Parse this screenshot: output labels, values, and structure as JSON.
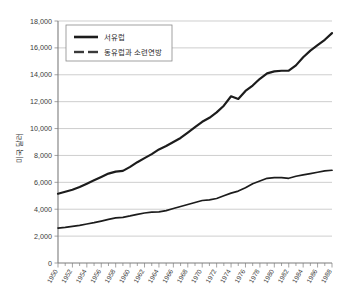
{
  "chart_data": {
    "type": "line",
    "title": "",
    "xlabel": "",
    "ylabel": "미국 달러",
    "ylim": [
      0,
      18000
    ],
    "ytick_values": [
      0,
      2000,
      4000,
      6000,
      8000,
      10000,
      12000,
      14000,
      16000,
      18000
    ],
    "ytick_labels": [
      "0",
      "2,000",
      "4,000",
      "6,000",
      "8,000",
      "10,000",
      "12,000",
      "14,000",
      "16,000",
      "18,000"
    ],
    "grid": true,
    "legend_position": "top-left",
    "x": [
      1950,
      1951,
      1952,
      1953,
      1954,
      1955,
      1956,
      1957,
      1958,
      1959,
      1960,
      1961,
      1962,
      1963,
      1964,
      1965,
      1966,
      1967,
      1968,
      1969,
      1970,
      1971,
      1972,
      1973,
      1974,
      1975,
      1976,
      1977,
      1978,
      1979,
      1980,
      1981,
      1982,
      1983,
      1984,
      1985,
      1986,
      1987,
      1988
    ],
    "xtick_labels": [
      "1950",
      "1952",
      "1954",
      "1956",
      "1958",
      "1960",
      "1962",
      "1964",
      "1966",
      "1968",
      "1970",
      "1972",
      "1974",
      "1976",
      "1978",
      "1980",
      "1982",
      "1984",
      "1986",
      "1988"
    ],
    "series": [
      {
        "name": "서유럽",
        "style": "solid",
        "color": "#1c1c1c",
        "values": [
          5150,
          5300,
          5450,
          5650,
          5900,
          6150,
          6400,
          6650,
          6800,
          6850,
          7150,
          7500,
          7800,
          8100,
          8450,
          8700,
          9000,
          9300,
          9700,
          10100,
          10500,
          10800,
          11200,
          11700,
          12400,
          12200,
          12800,
          13200,
          13700,
          14100,
          14250,
          14300,
          14300,
          14700,
          15300,
          15800,
          16200,
          16600,
          17100
        ]
      },
      {
        "name": "동유럽과 소련연방",
        "style": "dashed",
        "color": "#3a3a3a",
        "values": [
          2600,
          2650,
          2720,
          2800,
          2900,
          3000,
          3120,
          3250,
          3350,
          3400,
          3500,
          3620,
          3720,
          3780,
          3800,
          3900,
          4050,
          4200,
          4350,
          4500,
          4650,
          4700,
          4800,
          5000,
          5200,
          5350,
          5600,
          5900,
          6100,
          6300,
          6350,
          6350,
          6300,
          6450,
          6550,
          6650,
          6750,
          6850,
          6900
        ]
      }
    ]
  }
}
